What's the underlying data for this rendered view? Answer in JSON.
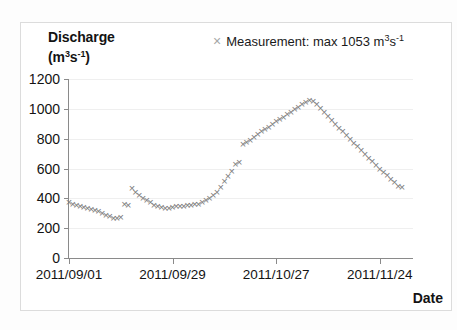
{
  "figure": {
    "background": "#ffffff",
    "border_color": "#dcdcdc"
  },
  "axis_titles": {
    "y_name": "Discharge",
    "y_unit_prefix": "(m",
    "y_unit_sup1": "3",
    "y_unit_mid": "s",
    "y_unit_sup2": "-1",
    "y_unit_suffix": ")",
    "x_title": "Date"
  },
  "legend": {
    "marker_symbol": "×",
    "marker_color": "#a6a6a6",
    "text_prefix": "Measurement: max 1053 m",
    "text_sup1": "3",
    "text_mid": "s",
    "text_sup2": "-1"
  },
  "chart_data": {
    "type": "scatter",
    "title": "",
    "xlabel": "Date",
    "ylabel": "Discharge (m3 s-1)",
    "series_name": "Measurement",
    "annotation": "max 1053 m3s-1",
    "max_value": 1053,
    "marker": "x",
    "marker_color": "#7c7c7c",
    "grid": true,
    "grid_color": "#efefef",
    "legend_position": "top-right",
    "ylim": [
      0,
      1200
    ],
    "yticks": [
      0,
      200,
      400,
      600,
      800,
      1000,
      1200
    ],
    "ytick_labels": [
      "0",
      "200",
      "400",
      "600",
      "800",
      "1000",
      "1200"
    ],
    "xlim_days": [
      0,
      93
    ],
    "xticks_days": [
      0,
      28,
      56,
      84
    ],
    "xtick_labels": [
      "2011/09/01",
      "2011/09/29",
      "2011/10/27",
      "2011/11/24"
    ],
    "x_start_date": "2011/09/01",
    "x_day_index": [
      0,
      1,
      2,
      3,
      4,
      5,
      6,
      7,
      8,
      9,
      10,
      11,
      12,
      13,
      14,
      15,
      16,
      17,
      18,
      19,
      20,
      21,
      22,
      23,
      24,
      25,
      26,
      27,
      28,
      29,
      30,
      31,
      32,
      33,
      34,
      35,
      36,
      37,
      38,
      39,
      40,
      41,
      42,
      43,
      44,
      45,
      46,
      47,
      48,
      49,
      50,
      51,
      52,
      53,
      54,
      55,
      56,
      57,
      58,
      59,
      60,
      61,
      62,
      63,
      64,
      65,
      66,
      67,
      68,
      69,
      70,
      71,
      72,
      73,
      74,
      75,
      76,
      77,
      78,
      79,
      80,
      81,
      82,
      83,
      84,
      85,
      86,
      87,
      88,
      89,
      90,
      91,
      92,
      93
    ],
    "values": [
      370,
      360,
      352,
      345,
      338,
      332,
      325,
      318,
      310,
      300,
      288,
      275,
      268,
      265,
      272,
      362,
      352,
      465,
      442,
      420,
      400,
      385,
      370,
      355,
      345,
      338,
      335,
      335,
      338,
      342,
      345,
      348,
      352,
      355,
      358,
      362,
      372,
      385,
      400,
      420,
      442,
      470,
      510,
      545,
      580,
      625,
      640,
      760,
      775,
      790,
      810,
      828,
      845,
      862,
      878,
      895,
      912,
      928,
      945,
      962,
      978,
      995,
      1012,
      1028,
      1042,
      1053,
      1048,
      1030,
      1005,
      975,
      948,
      920,
      895,
      870,
      845,
      820,
      795,
      770,
      745,
      720,
      695,
      670,
      645,
      620,
      595,
      572,
      550,
      528,
      505,
      482,
      470
    ]
  }
}
